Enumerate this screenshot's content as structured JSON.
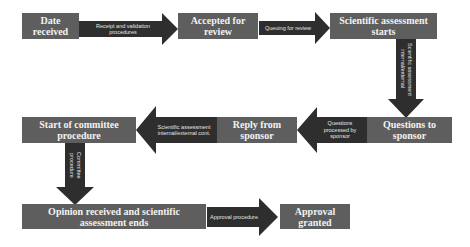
{
  "diagram": {
    "colors": {
      "box": "#5e5e5e",
      "arrow": "#2e2e2e",
      "text": "#f2f2f2",
      "background": "#ffffff"
    },
    "nodes": [
      {
        "id": "date-received",
        "label": "Date received"
      },
      {
        "id": "accepted-for-review",
        "label": "Accepted for review"
      },
      {
        "id": "scientific-assessment-starts",
        "label": "Scientific assessment starts"
      },
      {
        "id": "questions-to-sponsor",
        "label": "Questions to sponsor"
      },
      {
        "id": "reply-from-sponsor",
        "label": "Reply from sponsor"
      },
      {
        "id": "start-of-committee-procedure",
        "label": "Start of committee procedure"
      },
      {
        "id": "opinion-received",
        "label": "Opinion received and scientific assessment ends"
      },
      {
        "id": "approval-granted",
        "label": "Approval granted"
      }
    ],
    "edges": [
      {
        "from": "date-received",
        "to": "accepted-for-review",
        "label": "Receipt and validation procedures",
        "direction": "right"
      },
      {
        "from": "accepted-for-review",
        "to": "scientific-assessment-starts",
        "label": "Queuing for review",
        "direction": "right"
      },
      {
        "from": "scientific-assessment-starts",
        "to": "questions-to-sponsor",
        "label": "Scientific assessment internal/external",
        "direction": "down"
      },
      {
        "from": "questions-to-sponsor",
        "to": "reply-from-sponsor",
        "label": "Questions processed by sponsor",
        "direction": "left"
      },
      {
        "from": "reply-from-sponsor",
        "to": "start-of-committee-procedure",
        "label": "Scientific assessment internal/external cont.",
        "direction": "left"
      },
      {
        "from": "start-of-committee-procedure",
        "to": "opinion-received",
        "label": "Committee procedure",
        "direction": "down"
      },
      {
        "from": "opinion-received",
        "to": "approval-granted",
        "label": "Approval procedure",
        "direction": "right"
      }
    ]
  }
}
